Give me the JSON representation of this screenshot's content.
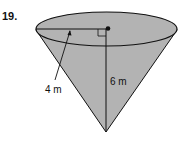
{
  "problem": {
    "number": "19.",
    "shape": "cone",
    "radius_label": "4 m",
    "height_label": "6 m"
  },
  "colors": {
    "fill": "#b3b3b3",
    "stroke": "#111111",
    "background": "#ffffff"
  }
}
